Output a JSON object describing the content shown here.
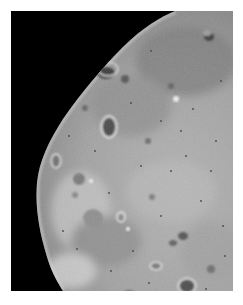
{
  "image": {
    "subject": "Cratered moon surface (grayscale spacecraft photo)",
    "background_color": "#000000",
    "page_color": "#ffffff",
    "surface_base_color": "#9a9a9a",
    "surface_light_color": "#c8c8c8",
    "surface_dark_color": "#6e6e6e",
    "frame": {
      "x": 11,
      "y": 11,
      "width": 222,
      "height": 280
    }
  }
}
